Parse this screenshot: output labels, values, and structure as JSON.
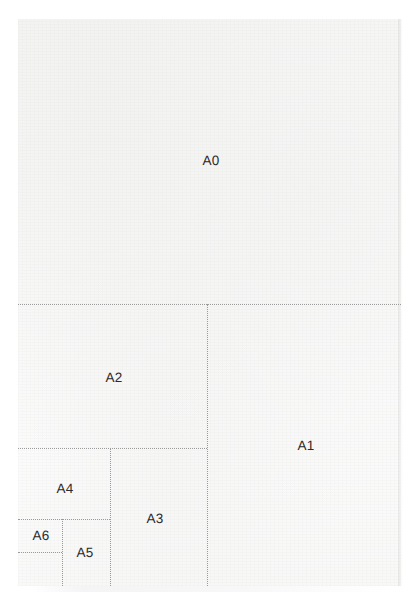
{
  "figure": {
    "kind": "paper-size-nesting-diagram",
    "standard_series": "A",
    "sheet": {
      "left": 18,
      "top": 19,
      "width": 383,
      "height": 567,
      "background_color": "#f8f8f7",
      "border_color": "#e6e6e4"
    },
    "line_style": {
      "pattern": "dotted",
      "color": "#9a9a9a",
      "width_px": 1
    },
    "regions": [
      {
        "id": "a0",
        "label": "A0",
        "label_x": 211,
        "label_y": 161,
        "x": 18,
        "y": 19,
        "width": 383,
        "height": 285
      },
      {
        "id": "a1",
        "label": "A1",
        "label_x": 306,
        "label_y": 446,
        "x": 207,
        "y": 304,
        "width": 194,
        "height": 282
      },
      {
        "id": "a2",
        "label": "A2",
        "label_x": 114,
        "label_y": 378,
        "x": 18,
        "y": 304,
        "width": 189,
        "height": 144
      },
      {
        "id": "a3",
        "label": "A3",
        "label_x": 155,
        "label_y": 519,
        "x": 110,
        "y": 448,
        "width": 97,
        "height": 138
      },
      {
        "id": "a4",
        "label": "A4",
        "label_x": 65,
        "label_y": 489,
        "x": 18,
        "y": 448,
        "width": 92,
        "height": 71
      },
      {
        "id": "a5",
        "label": "A5",
        "label_x": 85,
        "label_y": 553,
        "x": 62,
        "y": 519,
        "width": 48,
        "height": 67
      },
      {
        "id": "a6",
        "label": "A6",
        "label_x": 41,
        "label_y": 536,
        "x": 18,
        "y": 519,
        "width": 44,
        "height": 33
      }
    ],
    "fold_lines": {
      "horizontal": [
        {
          "id": "a0-a1-split",
          "x": 18,
          "y": 304,
          "length": 383
        },
        {
          "id": "a2-a4-split",
          "x": 18,
          "y": 448,
          "length": 189
        },
        {
          "id": "a4-a6-split",
          "x": 18,
          "y": 519,
          "length": 92
        },
        {
          "id": "a6-bottom",
          "x": 18,
          "y": 552,
          "length": 44
        }
      ],
      "vertical": [
        {
          "id": "a1-a2-split",
          "x": 207,
          "y": 304,
          "length": 282
        },
        {
          "id": "a3-a4-split",
          "x": 110,
          "y": 448,
          "length": 138
        },
        {
          "id": "a5-a6-split",
          "x": 62,
          "y": 519,
          "length": 67
        }
      ]
    }
  }
}
